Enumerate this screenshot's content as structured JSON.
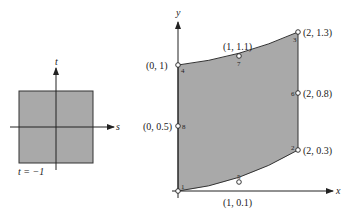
{
  "left_diagram": {
    "s_label": "s",
    "t_label": "t",
    "bottom_label": "t = −1",
    "fill": "#a9a9a9"
  },
  "right_diagram": {
    "x_label": "x",
    "y_label": "y",
    "fill": "#a9a9a9",
    "nodes": [
      {
        "id": "1",
        "coord": ""
      },
      {
        "id": "2",
        "coord": "(2, 0.3)"
      },
      {
        "id": "3",
        "coord": "(2, 1.3)"
      },
      {
        "id": "4",
        "coord": "(0, 1)"
      },
      {
        "id": "5",
        "coord": "(1, 0.1)"
      },
      {
        "id": "6",
        "coord": "(2, 0.8)"
      },
      {
        "id": "7",
        "coord": "(1, 1.1)"
      },
      {
        "id": "8",
        "coord": "(0, 0.5)"
      }
    ]
  }
}
